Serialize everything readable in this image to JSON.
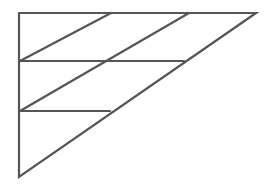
{
  "diagram": {
    "stroke_color": "#555555",
    "background": "#ffffff",
    "vertices": {
      "top_left": [
        19,
        13
      ],
      "top_right": [
        256,
        13
      ],
      "bottom_left": [
        19,
        177
      ]
    },
    "horizontals": [
      {
        "y": 61,
        "x1": 19,
        "x2": 184
      },
      {
        "y": 111,
        "x1": 19,
        "x2": 110
      }
    ],
    "diagonals": [
      {
        "x1": 111,
        "y1": 13,
        "x2": 20,
        "y2": 61
      },
      {
        "x1": 189,
        "y1": 13,
        "x2": 20,
        "y2": 111
      }
    ]
  }
}
